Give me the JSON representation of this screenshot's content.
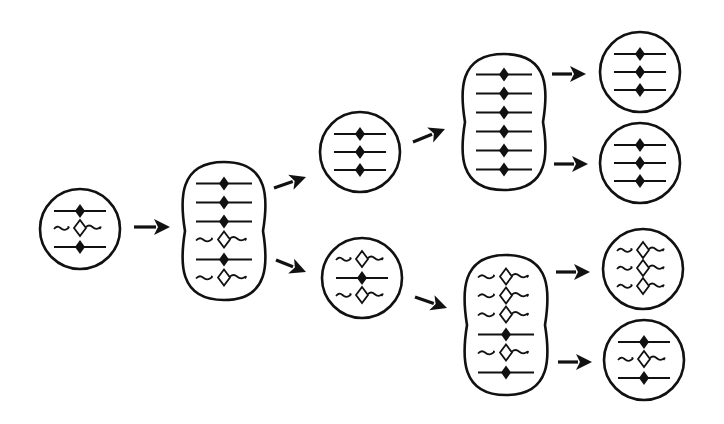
{
  "diagram": {
    "colors": {
      "stroke": "#111111",
      "background": "#ffffff",
      "hollow_fill": "#ffffff"
    },
    "legend": {
      "S": "solid strand with filled diamond",
      "W": "wavy strand with hollow diamond"
    },
    "cells": [
      {
        "id": "cell-0",
        "shape": "circle",
        "cx": 80,
        "cy": 229,
        "r": 40,
        "strands": [
          "S",
          "W",
          "S"
        ]
      },
      {
        "id": "cell-1",
        "shape": "dividing",
        "cx": 224,
        "cy": 231,
        "w": 88,
        "h": 138,
        "strands": [
          "S",
          "S",
          "S",
          "W",
          "S",
          "W"
        ]
      },
      {
        "id": "cell-2a",
        "shape": "circle",
        "cx": 360,
        "cy": 152,
        "r": 40,
        "strands": [
          "S",
          "S",
          "S"
        ]
      },
      {
        "id": "cell-2b",
        "shape": "circle",
        "cx": 362,
        "cy": 278,
        "r": 40,
        "strands": [
          "W",
          "S",
          "W"
        ]
      },
      {
        "id": "cell-3a",
        "shape": "dividing",
        "cx": 504,
        "cy": 122,
        "w": 88,
        "h": 136,
        "strands": [
          "S",
          "S",
          "S",
          "S",
          "S",
          "S"
        ]
      },
      {
        "id": "cell-3b",
        "shape": "dividing",
        "cx": 506,
        "cy": 325,
        "w": 88,
        "h": 140,
        "strands": [
          "W",
          "W",
          "W",
          "S",
          "W",
          "S"
        ]
      },
      {
        "id": "cell-4a",
        "shape": "circle",
        "cx": 640,
        "cy": 72,
        "r": 40,
        "strands": [
          "S",
          "S",
          "S"
        ]
      },
      {
        "id": "cell-4b",
        "shape": "circle",
        "cx": 640,
        "cy": 163,
        "r": 40,
        "strands": [
          "S",
          "S",
          "S"
        ]
      },
      {
        "id": "cell-4c",
        "shape": "circle",
        "cx": 643,
        "cy": 269,
        "r": 40,
        "strands": [
          "W",
          "W",
          "W"
        ]
      },
      {
        "id": "cell-4d",
        "shape": "circle",
        "cx": 644,
        "cy": 360,
        "r": 40,
        "strands": [
          "S",
          "W",
          "S"
        ]
      }
    ],
    "arrows": [
      {
        "id": "arrow-0-1",
        "x1": 134,
        "y1": 227,
        "x2": 170,
        "y2": 227
      },
      {
        "id": "arrow-1-2a",
        "x1": 274,
        "y1": 188,
        "x2": 306,
        "y2": 177
      },
      {
        "id": "arrow-1-2b",
        "x1": 276,
        "y1": 260,
        "x2": 306,
        "y2": 272
      },
      {
        "id": "arrow-2a-3a",
        "x1": 413,
        "y1": 142,
        "x2": 445,
        "y2": 129
      },
      {
        "id": "arrow-2b-3b",
        "x1": 415,
        "y1": 297,
        "x2": 447,
        "y2": 308
      },
      {
        "id": "arrow-3a-4a",
        "x1": 552,
        "y1": 74,
        "x2": 586,
        "y2": 74
      },
      {
        "id": "arrow-3a-4b",
        "x1": 554,
        "y1": 164,
        "x2": 588,
        "y2": 164
      },
      {
        "id": "arrow-3b-4c",
        "x1": 556,
        "y1": 272,
        "x2": 590,
        "y2": 272
      },
      {
        "id": "arrow-3b-4d",
        "x1": 558,
        "y1": 362,
        "x2": 592,
        "y2": 362
      }
    ]
  }
}
